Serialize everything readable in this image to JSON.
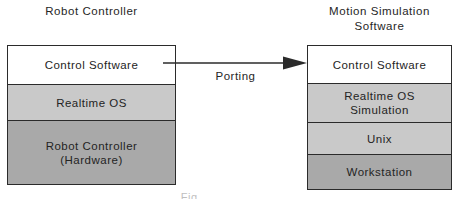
{
  "diagram": {
    "left": {
      "title": "Robot Controller",
      "layers": [
        {
          "label": "Control Software",
          "fill": "#ffffff"
        },
        {
          "label": "Realtime OS",
          "fill": "#c9c9c9"
        },
        {
          "label": "Robot Controller\n(Hardware)",
          "fill": "#a9a9a9"
        }
      ]
    },
    "right": {
      "title": "Motion Simulation\nSoftware",
      "layers": [
        {
          "label": "Control Software",
          "fill": "#ffffff"
        },
        {
          "label": "Realtime OS\nSimulation",
          "fill": "#c9c9c9"
        },
        {
          "label": "Unix",
          "fill": "#c9c9c9"
        },
        {
          "label": "Workstation",
          "fill": "#a9a9a9"
        }
      ]
    },
    "arrow": {
      "label": "Porting",
      "direction": "right",
      "color": "#2b2b2b"
    },
    "caption": "Fig."
  },
  "colors": {
    "stroke": "#2b2b2b",
    "light_gray": "#c9c9c9",
    "dark_gray": "#a9a9a9",
    "white": "#ffffff",
    "text": "#242424"
  }
}
